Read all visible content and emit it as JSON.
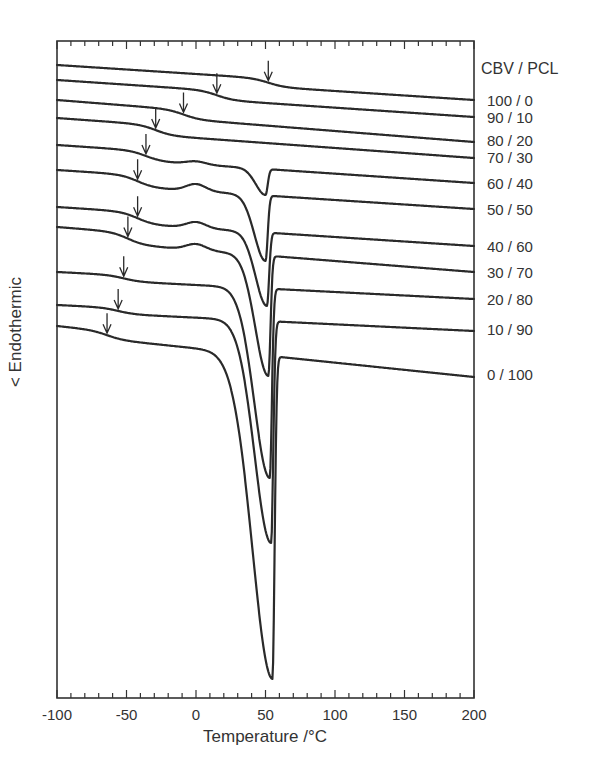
{
  "chart_data": {
    "type": "line",
    "title": "",
    "xlabel": "Temperature /°C",
    "ylabel": "< Endothermic",
    "xlim": [
      -100,
      200
    ],
    "x_ticks": [
      "-100",
      "-50",
      "0",
      "50",
      "100",
      "150",
      "200"
    ],
    "x_minor_tick_step": 10,
    "y_ticks": [],
    "grid": false,
    "legend_title": "CBV / PCL",
    "legend_position": "right, labels aligned to curve ends",
    "series": [
      {
        "name": "100 / 0",
        "tg_arrow_C": 52,
        "melting_peak_C": null,
        "peak_depth": "none"
      },
      {
        "name": "90 / 10",
        "tg_arrow_C": 15,
        "melting_peak_C": null,
        "peak_depth": "none"
      },
      {
        "name": "80 / 20",
        "tg_arrow_C": -9,
        "melting_peak_C": null,
        "peak_depth": "none"
      },
      {
        "name": "70 / 30",
        "tg_arrow_C": -29,
        "melting_peak_C": null,
        "peak_depth": "none"
      },
      {
        "name": "60 / 40",
        "tg_arrow_C": -36,
        "melting_peak_C": 50,
        "peak_depth": "small"
      },
      {
        "name": "50 / 50",
        "tg_arrow_C": -42,
        "melting_peak_C": 50,
        "peak_depth": "medium"
      },
      {
        "name": "40 / 60",
        "tg_arrow_C": -42,
        "melting_peak_C": 51,
        "peak_depth": "medium"
      },
      {
        "name": "30 / 70",
        "tg_arrow_C": -49,
        "melting_peak_C": 52,
        "peak_depth": "large"
      },
      {
        "name": "20 / 80",
        "tg_arrow_C": -52,
        "melting_peak_C": 53,
        "peak_depth": "large"
      },
      {
        "name": "10 / 90",
        "tg_arrow_C": -56,
        "melting_peak_C": 54,
        "peak_depth": "very large"
      },
      {
        "name": "0 / 100",
        "tg_arrow_C": -64,
        "melting_peak_C": 55,
        "peak_depth": "largest"
      }
    ]
  },
  "legend": {
    "title": "CBV / PCL",
    "items": [
      "100 / 0",
      "90 / 10",
      "80 / 20",
      "70 / 30",
      "60 / 40",
      "50 / 50",
      "40 / 60",
      "30 / 70",
      "20 / 80",
      "10 / 90",
      "0 / 100"
    ]
  },
  "axes": {
    "xlabel": "Temperature /°C",
    "ylabel": "< Endothermic",
    "xticks": [
      "-100",
      "-50",
      "0",
      "50",
      "100",
      "150",
      "200"
    ]
  }
}
